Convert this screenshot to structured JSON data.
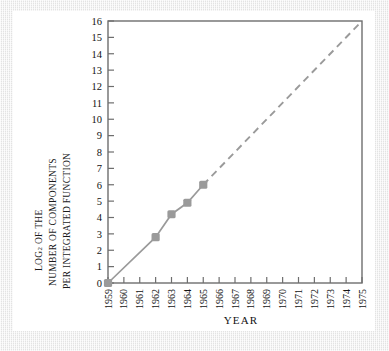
{
  "figure": {
    "background": "#ffffff",
    "mat_color": "#ececec",
    "series_color": "#9a9a9a",
    "axis_color": "#6e6e6e",
    "text_color": "#121212"
  },
  "axis_labels": {
    "y_line1": "LOG",
    "y_line1_sub": "2",
    "y_line1_tail": " OF THE",
    "y_line2": "NUMBER OF COMPONENTS",
    "y_line3": "PER INTEGRATED FUNCTION",
    "x_title": "YEAR"
  },
  "chart_data": {
    "type": "line",
    "title": "",
    "xlabel": "YEAR",
    "ylabel": "LOG2 OF THE NUMBER OF COMPONENTS PER INTEGRATED FUNCTION",
    "xlim": [
      1959,
      1975
    ],
    "ylim": [
      0,
      16
    ],
    "grid": false,
    "legend": "none",
    "x_tick_labels": [
      "1959",
      "1960",
      "1961",
      "1962",
      "1963",
      "1964",
      "1965",
      "1966",
      "1967",
      "1968",
      "1969",
      "1970",
      "1971",
      "1972",
      "1973",
      "1974",
      "1975"
    ],
    "y_tick_labels": [
      "0",
      "1",
      "2",
      "3",
      "4",
      "5",
      "6",
      "7",
      "8",
      "9",
      "10",
      "11",
      "12",
      "13",
      "14",
      "15",
      "16"
    ],
    "series": [
      {
        "name": "observed",
        "style": "solid",
        "marker": "square",
        "x": [
          1959,
          1962,
          1963,
          1964,
          1965
        ],
        "values": [
          0,
          2.8,
          4.2,
          4.9,
          6.0
        ]
      },
      {
        "name": "extrapolation",
        "style": "dashed",
        "marker": "none",
        "x": [
          1965,
          1975
        ],
        "values": [
          6.0,
          16.0
        ]
      }
    ]
  }
}
